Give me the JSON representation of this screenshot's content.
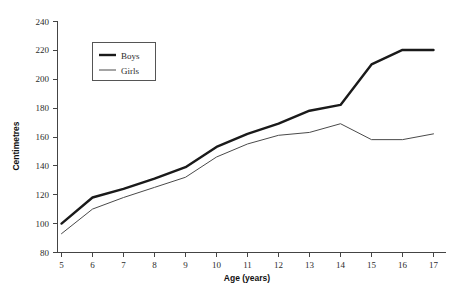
{
  "chart_data": {
    "type": "line",
    "title": "",
    "xlabel": "Age (years)",
    "ylabel": "Centimetres",
    "x": [
      5,
      6,
      7,
      8,
      9,
      10,
      11,
      12,
      13,
      14,
      15,
      16,
      17
    ],
    "categories": [
      "5",
      "6",
      "7",
      "8",
      "9",
      "10",
      "11",
      "12",
      "13",
      "14",
      "15",
      "16",
      "17"
    ],
    "series": [
      {
        "name": "Boys",
        "values": [
          100,
          118,
          124,
          131,
          139,
          153,
          162,
          169,
          178,
          182,
          210,
          220,
          220
        ],
        "color": "#1a1a1a",
        "width": 2.4
      },
      {
        "name": "Girls",
        "values": [
          93,
          110,
          118,
          125,
          132,
          146,
          155,
          161,
          163,
          169,
          158,
          158,
          162
        ],
        "color": "#4a4a4a",
        "width": 1
      }
    ],
    "xlim": [
      5,
      17
    ],
    "ylim": [
      80,
      240
    ],
    "ytick_values": [
      80,
      100,
      120,
      140,
      160,
      180,
      200,
      220,
      240
    ],
    "ytick_labels": [
      "80",
      "100",
      "120",
      "140",
      "160",
      "180",
      "200",
      "220",
      "240"
    ],
    "xtick_labels": [
      "5",
      "6",
      "7",
      "8",
      "9",
      "10",
      "11",
      "12",
      "13",
      "14",
      "15",
      "16",
      "17"
    ],
    "grid": false,
    "legend_position": "upper-left-inside",
    "legend_entries": [
      "Boys",
      "Girls"
    ]
  },
  "legend": {
    "boys_label": "Boys",
    "girls_label": "Girls"
  },
  "axes": {
    "x_title": "Age (years)",
    "y_title": "Centimetres"
  }
}
